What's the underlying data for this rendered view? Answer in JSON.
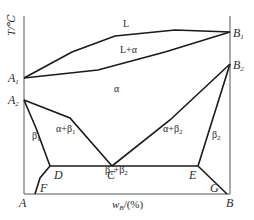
{
  "diagram": {
    "type": "binary phase diagram",
    "y_axis_label": "T/℃",
    "x_axis_label": "w",
    "x_axis_label_sub": "B",
    "x_axis_label_unit": "/(%)",
    "points": {
      "A": "A",
      "B": "B",
      "A1": {
        "base": "A",
        "sub": "1"
      },
      "A2": {
        "base": "A",
        "sub": "2"
      },
      "B1": {
        "base": "B",
        "sub": "1"
      },
      "B2": {
        "base": "B",
        "sub": "2"
      },
      "C": "C",
      "D": "D",
      "E": "E",
      "F": "F",
      "G": "G"
    },
    "regions": {
      "liquid": "L",
      "liquid_alpha": "L+α",
      "alpha": "α",
      "alpha_beta1": {
        "base": "α+β",
        "sub": "1"
      },
      "alpha_beta2": {
        "base": "α+β",
        "sub": "2"
      },
      "beta1": {
        "base": "β",
        "sub": "1"
      },
      "beta2": {
        "base": "β",
        "sub": "2"
      },
      "beta1_beta2": {
        "a": "β",
        "a_sub": "1",
        "plus": "+β",
        "b_sub": "2"
      }
    },
    "colors": {
      "line": "#1a1a1a",
      "axis": "#555555",
      "text": "#2a2a2a"
    }
  }
}
